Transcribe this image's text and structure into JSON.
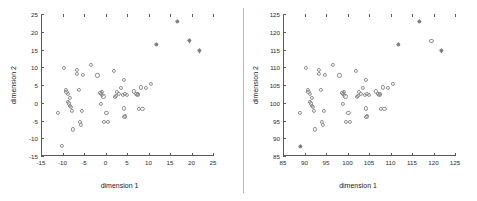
{
  "figure": {
    "background": "#ffffff",
    "marker_circle_color": "#8e8e8e",
    "marker_star_color": "#7d7d7d",
    "axis_color": "#5a5a5a",
    "divider_color": "#b9b9b9"
  },
  "chart_data": [
    {
      "id": "left",
      "type": "scatter",
      "title": "",
      "xlabel": "dimension 1",
      "ylabel": "dimension 2",
      "xlim": [
        -15,
        25
      ],
      "ylim": [
        -15,
        25
      ],
      "xticks": [
        -15,
        -10,
        -5,
        0,
        5,
        10,
        15,
        20,
        25
      ],
      "yticks": [
        -15,
        -10,
        -5,
        0,
        5,
        10,
        15,
        20,
        25
      ],
      "xticklabels": [
        "-15",
        "-10",
        "-5",
        "0",
        "5",
        "10",
        "15",
        "20",
        "25"
      ],
      "yticklabels": [
        "-15",
        "-10",
        "-5",
        "0",
        "5",
        "10",
        "15",
        "20",
        "25"
      ],
      "grid": false,
      "legend": null,
      "series": [
        {
          "name": "inliers",
          "marker": "circle",
          "points": [
            [
              -10.2,
              -12.2
            ],
            [
              -11.0,
              -2.8
            ],
            [
              -9.6,
              9.8
            ],
            [
              -9.3,
              3.7
            ],
            [
              -9.1,
              3.0
            ],
            [
              -8.8,
              2.6
            ],
            [
              -8.7,
              0.3
            ],
            [
              -8.5,
              -0.2
            ],
            [
              -8.3,
              1.3
            ],
            [
              -8.2,
              -0.9
            ],
            [
              -8.1,
              -1.1
            ],
            [
              -7.8,
              -2.4
            ],
            [
              -7.6,
              -7.5
            ],
            [
              -6.7,
              9.2
            ],
            [
              -6.6,
              8.2
            ],
            [
              -6.2,
              3.7
            ],
            [
              -5.9,
              -5.4
            ],
            [
              -5.7,
              -6.2
            ],
            [
              -5.4,
              -2.3
            ],
            [
              -5.2,
              7.9
            ],
            [
              -3.3,
              10.6
            ],
            [
              -1.9,
              7.7
            ],
            [
              -1.2,
              2.8
            ],
            [
              -1.1,
              2.6
            ],
            [
              -1.0,
              -0.4
            ],
            [
              -0.9,
              3.1
            ],
            [
              -0.8,
              2.2
            ],
            [
              -0.5,
              1.8
            ],
            [
              -0.3,
              -5.5
            ],
            [
              0.2,
              -2.8
            ],
            [
              0.5,
              -5.4
            ],
            [
              2.0,
              8.9
            ],
            [
              2.1,
              1.6
            ],
            [
              2.4,
              2.0
            ],
            [
              2.6,
              3.1
            ],
            [
              3.1,
              2.4
            ],
            [
              3.6,
              4.1
            ],
            [
              4.0,
              2.2
            ],
            [
              4.2,
              -1.6
            ],
            [
              4.3,
              6.4
            ],
            [
              4.4,
              -3.9
            ],
            [
              4.5,
              -3.6
            ],
            [
              4.6,
              2.4
            ],
            [
              5.0,
              2.1
            ],
            [
              6.6,
              3.2
            ],
            [
              7.2,
              2.6
            ],
            [
              7.4,
              2.3
            ],
            [
              7.6,
              2.5
            ],
            [
              7.7,
              -1.7
            ],
            [
              8.3,
              4.3
            ],
            [
              8.6,
              -1.7
            ],
            [
              9.4,
              4.1
            ],
            [
              10.5,
              5.2
            ]
          ]
        },
        {
          "name": "outliers",
          "marker": "star",
          "points": [
            [
              11.8,
              16.4
            ],
            [
              16.7,
              23.0
            ],
            [
              19.5,
              17.4
            ],
            [
              21.8,
              14.6
            ]
          ]
        }
      ]
    },
    {
      "id": "right",
      "type": "scatter",
      "title": "",
      "xlabel": "dimension 1",
      "ylabel": "dimension 2",
      "xlim": [
        85,
        125
      ],
      "ylim": [
        85,
        125
      ],
      "xticks": [
        85,
        90,
        95,
        100,
        105,
        110,
        115,
        120,
        125
      ],
      "yticks": [
        85,
        90,
        95,
        100,
        105,
        110,
        115,
        120,
        125
      ],
      "xticklabels": [
        "85",
        "90",
        "95",
        "100",
        "105",
        "110",
        "115",
        "120",
        "125"
      ],
      "yticklabels": [
        "85",
        "90",
        "95",
        "100",
        "105",
        "110",
        "115",
        "120",
        "125"
      ],
      "grid": false,
      "legend": null,
      "series": [
        {
          "name": "inliers",
          "marker": "circle",
          "points": [
            [
              89.0,
              97.2
            ],
            [
              90.4,
              109.8
            ],
            [
              90.7,
              103.7
            ],
            [
              90.9,
              103.0
            ],
            [
              91.2,
              102.6
            ],
            [
              91.3,
              100.3
            ],
            [
              91.5,
              99.8
            ],
            [
              91.7,
              101.3
            ],
            [
              91.8,
              99.1
            ],
            [
              91.9,
              98.9
            ],
            [
              92.2,
              97.6
            ],
            [
              92.4,
              92.5
            ],
            [
              93.3,
              109.2
            ],
            [
              93.4,
              108.2
            ],
            [
              93.8,
              103.7
            ],
            [
              94.1,
              94.6
            ],
            [
              94.3,
              93.8
            ],
            [
              94.6,
              97.7
            ],
            [
              94.8,
              107.9
            ],
            [
              96.7,
              110.6
            ],
            [
              98.1,
              107.7
            ],
            [
              98.8,
              102.8
            ],
            [
              98.9,
              102.6
            ],
            [
              99.0,
              99.6
            ],
            [
              99.1,
              103.1
            ],
            [
              99.2,
              102.2
            ],
            [
              99.5,
              101.8
            ],
            [
              99.7,
              94.5
            ],
            [
              100.2,
              97.2
            ],
            [
              100.5,
              94.6
            ],
            [
              102.0,
              108.9
            ],
            [
              102.1,
              101.6
            ],
            [
              102.4,
              102.0
            ],
            [
              102.6,
              103.1
            ],
            [
              103.1,
              102.4
            ],
            [
              103.6,
              104.1
            ],
            [
              104.0,
              102.2
            ],
            [
              104.2,
              98.4
            ],
            [
              104.3,
              106.4
            ],
            [
              104.4,
              96.1
            ],
            [
              104.5,
              96.4
            ],
            [
              104.6,
              102.4
            ],
            [
              105.0,
              102.1
            ],
            [
              106.6,
              103.2
            ],
            [
              107.2,
              102.6
            ],
            [
              107.4,
              102.3
            ],
            [
              107.6,
              102.5
            ],
            [
              107.7,
              98.3
            ],
            [
              108.3,
              104.3
            ],
            [
              108.6,
              98.3
            ],
            [
              109.4,
              104.1
            ],
            [
              110.5,
              105.2
            ],
            [
              119.5,
              117.4
            ]
          ]
        },
        {
          "name": "outliers",
          "marker": "star",
          "points": [
            [
              89.0,
              87.8
            ],
            [
              111.8,
              116.4
            ],
            [
              116.7,
              123.0
            ],
            [
              121.8,
              114.6
            ]
          ]
        }
      ]
    }
  ]
}
